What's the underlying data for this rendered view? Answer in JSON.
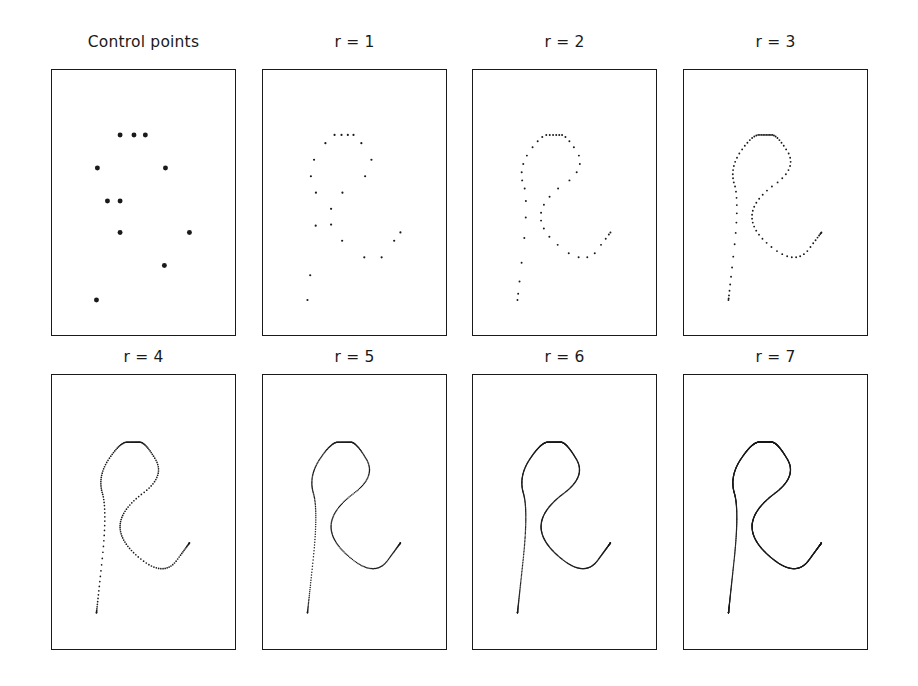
{
  "figure": {
    "width": 918,
    "height": 686,
    "background": "#ffffff",
    "ink_color": "#1a1a1a",
    "rows": 2,
    "cols": 4
  },
  "chart_data": {
    "type": "scatter",
    "title": "",
    "xlabel": "",
    "ylabel": "",
    "grid": false,
    "legend": null,
    "axis_ranges": {
      "xlim": [
        0,
        1
      ],
      "ylim": [
        0,
        1
      ]
    },
    "control_points_normalized": [
      [
        0.372,
        0.755
      ],
      [
        0.448,
        0.755
      ],
      [
        0.51,
        0.755
      ],
      [
        0.248,
        0.63
      ],
      [
        0.62,
        0.63
      ],
      [
        0.303,
        0.506
      ],
      [
        0.372,
        0.506
      ],
      [
        0.372,
        0.387
      ],
      [
        0.751,
        0.387
      ],
      [
        0.614,
        0.262
      ],
      [
        0.243,
        0.132
      ]
    ],
    "subdivision_order": [
      [
        0.243,
        0.132
      ],
      [
        0.303,
        0.506
      ],
      [
        0.248,
        0.63
      ],
      [
        0.372,
        0.755
      ],
      [
        0.448,
        0.755
      ],
      [
        0.51,
        0.755
      ],
      [
        0.62,
        0.63
      ],
      [
        0.372,
        0.506
      ],
      [
        0.372,
        0.387
      ],
      [
        0.614,
        0.262
      ],
      [
        0.751,
        0.387
      ]
    ],
    "panels": [
      {
        "id": "control-points",
        "label": "Control points",
        "r": null,
        "marker": "dot",
        "marker_size": 5.0,
        "point_count": 11,
        "render": "points"
      },
      {
        "id": "r1",
        "label": "r = 1",
        "r": 1,
        "marker": "dot",
        "marker_size": 2.2,
        "point_count": 20,
        "render": "points"
      },
      {
        "id": "r2",
        "label": "r = 2",
        "r": 2,
        "marker": "dot",
        "marker_size": 2.0,
        "point_count": 38,
        "render": "points"
      },
      {
        "id": "r3",
        "label": "r = 3",
        "r": 3,
        "marker": "dot",
        "marker_size": 1.9,
        "point_count": 74,
        "render": "points"
      },
      {
        "id": "r4",
        "label": "r = 4",
        "r": 4,
        "marker": "dot",
        "marker_size": 1.7,
        "point_count": 146,
        "render": "points"
      },
      {
        "id": "r5",
        "label": "r = 5",
        "r": 5,
        "marker": "dot",
        "marker_size": 1.5,
        "point_count": 290,
        "render": "points"
      },
      {
        "id": "r6",
        "label": "r = 6",
        "r": 6,
        "marker": "dot",
        "marker_size": 1.4,
        "point_count": 578,
        "render": "points"
      },
      {
        "id": "r7",
        "label": "r = 7",
        "r": 7,
        "marker": "dot",
        "marker_size": 1.3,
        "point_count": 1154,
        "render": "points"
      }
    ],
    "panel_geometry": [
      {
        "id": "control-points",
        "x": 51,
        "y": 69,
        "w": 185,
        "h": 267,
        "title_x": 51,
        "title_y": 33,
        "title_w": 185
      },
      {
        "id": "r1",
        "x": 262,
        "y": 69,
        "w": 185,
        "h": 267,
        "title_x": 262,
        "title_y": 33,
        "title_w": 185
      },
      {
        "id": "r2",
        "x": 472,
        "y": 69,
        "w": 185,
        "h": 267,
        "title_x": 472,
        "title_y": 33,
        "title_w": 185
      },
      {
        "id": "r3",
        "x": 683,
        "y": 69,
        "w": 185,
        "h": 267,
        "title_x": 683,
        "title_y": 33,
        "title_w": 185
      },
      {
        "id": "r4",
        "x": 51,
        "y": 374,
        "w": 185,
        "h": 276,
        "title_x": 51,
        "title_y": 348,
        "title_w": 185
      },
      {
        "id": "r5",
        "x": 262,
        "y": 374,
        "w": 185,
        "h": 276,
        "title_x": 262,
        "title_y": 348,
        "title_w": 185
      },
      {
        "id": "r6",
        "x": 472,
        "y": 374,
        "w": 185,
        "h": 276,
        "title_x": 472,
        "title_y": 348,
        "title_w": 185
      },
      {
        "id": "r7",
        "x": 683,
        "y": 374,
        "w": 185,
        "h": 276,
        "title_x": 683,
        "title_y": 348,
        "title_w": 185
      }
    ]
  }
}
